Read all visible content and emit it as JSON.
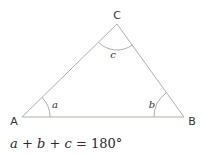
{
  "diagram": {
    "vertices": [
      {
        "id": "A",
        "label": "A"
      },
      {
        "id": "B",
        "label": "B"
      },
      {
        "id": "C",
        "label": "C"
      }
    ],
    "angles": [
      {
        "vertex": "A",
        "label": "a"
      },
      {
        "vertex": "B",
        "label": "b"
      },
      {
        "vertex": "C",
        "label": "c"
      }
    ],
    "equation": {
      "a": "a",
      "b": "b",
      "c": "c",
      "plus": "+",
      "equals": "=",
      "total": "180°"
    },
    "colors": {
      "line": "#a9b3a9",
      "text": "#333333"
    }
  }
}
